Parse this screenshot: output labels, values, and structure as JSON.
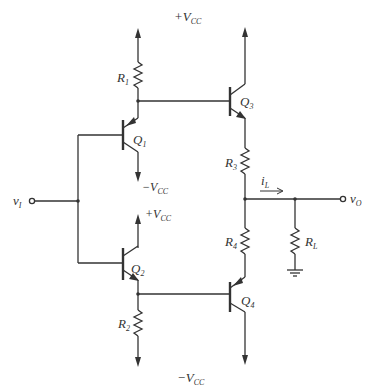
{
  "diagram": {
    "type": "circuit-schematic",
    "colors": {
      "ink": "#333333",
      "background": "#ffffff"
    },
    "supplies": {
      "top": {
        "sign": "+",
        "main": "V",
        "sub": "CC"
      },
      "bottom": {
        "sign": "−",
        "main": "V",
        "sub": "CC"
      },
      "q1_collector": {
        "sign": "−",
        "main": "V",
        "sub": "CC"
      },
      "q2_collector": {
        "sign": "+",
        "main": "V",
        "sub": "CC"
      }
    },
    "components": {
      "R1": {
        "main": "R",
        "sub": "1"
      },
      "R2": {
        "main": "R",
        "sub": "2"
      },
      "R3": {
        "main": "R",
        "sub": "3"
      },
      "R4": {
        "main": "R",
        "sub": "4"
      },
      "RL": {
        "main": "R",
        "sub": "L"
      },
      "Q1": {
        "main": "Q",
        "sub": "1",
        "kind": "PNP"
      },
      "Q2": {
        "main": "Q",
        "sub": "2",
        "kind": "NPN"
      },
      "Q3": {
        "main": "Q",
        "sub": "3",
        "kind": "NPN"
      },
      "Q4": {
        "main": "Q",
        "sub": "4",
        "kind": "PNP"
      }
    },
    "terminals": {
      "input": {
        "main": "v",
        "sub": "I"
      },
      "output": {
        "main": "v",
        "sub": "O"
      }
    },
    "current": {
      "main": "i",
      "sub": "L"
    }
  }
}
